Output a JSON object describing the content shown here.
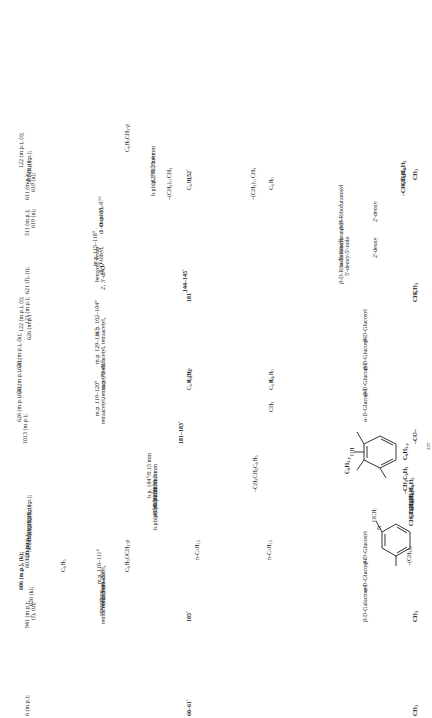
{
  "document": {
    "kind": "chemistry-reference-table",
    "orientation": "rotated-90-ccw",
    "page_marker": "227"
  },
  "columns": {
    "substituent": "substituent",
    "r1": "R1",
    "r2": "R2",
    "constants": "physical constants",
    "derivatives": "derivatives",
    "references": "references"
  },
  "structures": [
    {
      "name": "methoxy-pyridine-structure",
      "ring": "pyridine",
      "labels": [
        "OCH3",
        "N",
        "-(CH2)n-"
      ]
    },
    {
      "name": "hydroxy-benzophenone-structure",
      "ring": "benzene",
      "labels": [
        "OH",
        "C6H5-y",
        "C6H5-y",
        "-CO-"
      ]
    }
  ],
  "rows": [
    {
      "substituent": [
        "CH3"
      ],
      "r1": [],
      "r2": [],
      "constants": [],
      "derivatives": [],
      "references": [
        "6 (m.p.);"
      ]
    },
    {
      "substituent": [
        "CH3"
      ],
      "r1": [],
      "r2": [],
      "constants": [
        "60-61°"
      ],
      "derivatives": [
        "tetraacetyl,",
        "amorphous",
        "tetraacetyl",
        "m.p. 84-85°",
        "tetraacetyl,",
        "m.p. 110-111°"
      ],
      "references": [
        "941 (m.p.);",
        "(f), (u);",
        "626 (k);",
        "606 (m.p.), (k);",
        "603 (m.p.);",
        "620 (m.p.);",
        "581 (b.p.);",
        "581 (b.p.);",
        "581 (b.p.);",
        "581 (b.p.);",
        "581 (b.p.);"
      ]
    },
    {
      "substituent": [
        "β-D-Galactosyl"
      ],
      "r1": [
        "C6H5OCH3-p"
      ],
      "r2": [
        "C6H5"
      ],
      "constants": [
        "105°"
      ],
      "derivatives": [],
      "references": []
    },
    {
      "substituent": [
        "α-D-Glucosyl"
      ],
      "r1": [],
      "r2": [],
      "constants": [],
      "derivatives": [],
      "references": []
    },
    {
      "substituent": [
        "β-D-Glucosyl"
      ],
      "r1": [],
      "r2": [],
      "constants": [],
      "derivatives": [],
      "references": []
    },
    {
      "substituent": [
        "CH3C6H5",
        "CH3C6H5",
        "CH3C6H5",
        "CH3C6H5",
        "-CH2C6H5"
      ],
      "r1": [
        "n-C7H15",
        "-CH2CH2C6H5"
      ],
      "r2": [
        "n-C7H15"
      ],
      "constants": [
        "b.p. 148°/0.3 mm",
        "b.p. 140°/0.3 mm",
        "b.p. 142°/0.3 mm",
        "b.p. 120°/0.5 mm",
        "b.p. 184°/0.15 mm"
      ],
      "derivatives": [],
      "references": []
    },
    {
      "substituent": [
        "-CO-"
      ],
      "r1": [],
      "r2": [],
      "constants": [
        "181-183°"
      ],
      "derivatives": [],
      "references": [
        "1013 (m.p.);"
      ]
    },
    {
      "substituent": [
        "α-D-Glucosyl"
      ],
      "r1": [],
      "r2": [],
      "constants": [],
      "derivatives": [
        "tetraacetyl,",
        "m.p. 119-120°"
      ],
      "references": [
        "626 (m.p.), (k);"
      ]
    },
    {
      "substituent": [
        "β-D-Glucosyl"
      ],
      "r1": [],
      "r2": [],
      "constants": [],
      "derivatives": [
        "tetraacetyl,",
        "m.p. 79-81°"
      ],
      "references": [
        "626 (m.p.), (k);"
      ]
    },
    {
      "substituent": [
        "β-D-Glucosyl"
      ],
      "r1": [
        "CH3"
      ],
      "r2": [],
      "constants": [],
      "derivatives": [
        "tetraacetyl,",
        "m.p. 129-131°"
      ],
      "references": [
        "626 (m.p.), (k);"
      ]
    },
    {
      "substituent": [
        "β-D-Glucosyl"
      ],
      "r1": [
        "C6H5",
        "C6H5"
      ],
      "r2": [
        "C6H5BrP",
        "C6H5"
      ],
      "constants": [
        "181°",
        "144-145°"
      ],
      "derivatives": [
        "tetraacetyl,",
        "m.p. 102-104°"
      ],
      "references": [
        "626 (m.p.)",
        "122 (m.p.), (l);",
        "121 (m.p.);"
      ]
    },
    {
      "substituent": [
        "CH3",
        "CH3",
        "β-D-Ribofuranosyl-",
        "5'-deoxy-5'-iodo",
        "α-D-Ribofuranosyl-",
        "2'-deoxy"
      ],
      "r1": [],
      "r2": [],
      "constants": [],
      "derivatives": [
        "2', 3'-di-O-",
        "benzoyl, syrup",
        "di-O-tolsyl,",
        "m.p. 115-118°"
      ],
      "references": [
        "621 (f), (t);"
      ]
    },
    {
      "substituent": [
        "β-D-Ribofuranosyl-",
        "2'-deoxy"
      ],
      "r1": [],
      "r2": [],
      "constants": [],
      "derivatives": [
        "di-O-tolsyl,",
        "m.p. 85-87°"
      ],
      "references": [
        "511 (m.p.);",
        "619 (u);"
      ]
    },
    {
      "substituent": [
        "-CH3C6H5",
        "-CH3C6H5",
        "CH3"
      ],
      "r1": [
        "-(CH2)11CH3",
        "C6H5"
      ],
      "r2": [
        "-(CH2)11CH3",
        "C6H5"
      ],
      "constants": [
        "b.p. 182°/0.2 mm",
        "b.p. 190°/0.4 mm",
        "152°"
      ],
      "derivatives": [],
      "references": [
        "611 (m.p.);",
        "619 (u);",
        "581 (b.p.);",
        "581 (b.p.);",
        "122 (m.p.), (t);"
      ]
    }
  ],
  "column_text": {
    "references": [
      "6 (m.p.);",
      "941 (m.p.);",
      "(f), (u);",
      "626 (k);",
      "606 (m.p.), (k);",
      "603 (m.p.);",
      "620 (m.p.);",
      "581 (b.p.);",
      "581 (b.p.);",
      "581 (b.p.);",
      "581 (b.p.);",
      "581 (b.p.);",
      "1013 (m.p.);",
      "626 (m.p.), (k);",
      "626 (m.p.), (k);",
      "626 (m.p.), (k);",
      "626 (m.p.)",
      "122 (m.p.), (l);",
      "121 (m.p.);",
      "621 (f), (t);",
      "511 (m.p.);",
      "619 (u);",
      "611 (m.p.);",
      "619 (u);",
      "581 (b.p.);",
      "581 (b.p.);",
      "122 (m.p.), (t);"
    ]
  }
}
